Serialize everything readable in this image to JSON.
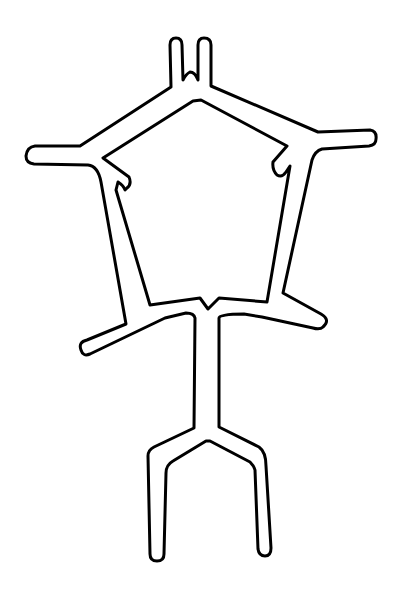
{
  "figure": {
    "stroke_color": "#000000",
    "background_color": "#ffffff",
    "stroke_width": 3
  }
}
